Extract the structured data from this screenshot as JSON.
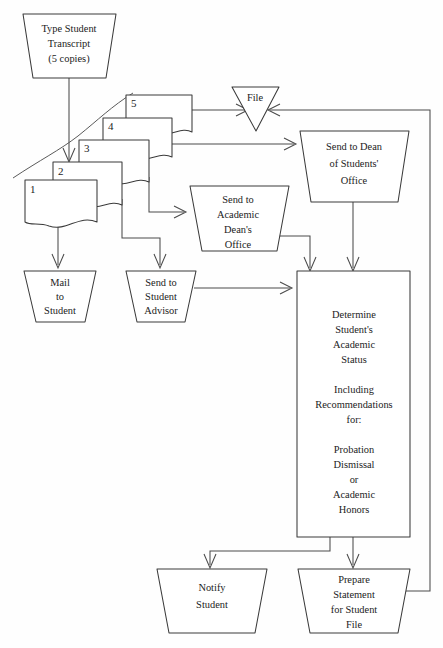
{
  "diagram": {
    "background_color": "#fefefe",
    "stroke_color": "#3a3a3a",
    "nodes": {
      "type_transcript": {
        "shape": "trapezoid",
        "lines": [
          "Type Student",
          "Transcript",
          "(5 copies)"
        ]
      },
      "file": {
        "shape": "inverted-triangle",
        "lines": [
          "File"
        ]
      },
      "dean_students": {
        "shape": "trapezoid",
        "lines": [
          "Send to Dean",
          "of Students'",
          "Office"
        ]
      },
      "academic_dean": {
        "shape": "trapezoid",
        "lines": [
          "Send to",
          "Academic",
          "Dean's",
          "Office"
        ]
      },
      "mail_student": {
        "shape": "trapezoid",
        "lines": [
          "Mail",
          "to",
          "Student"
        ]
      },
      "student_advisor": {
        "shape": "trapezoid",
        "lines": [
          "Send to",
          "Student",
          "Advisor"
        ]
      },
      "determine_status": {
        "shape": "rectangle",
        "lines": [
          "Determine",
          "Student's",
          "Academic",
          "Status",
          "",
          "Including",
          "Recommendations",
          "for:",
          "",
          "Probation",
          "Dismissal",
          "or",
          "Academic",
          "Honors"
        ]
      },
      "notify_student": {
        "shape": "trapezoid",
        "lines": [
          "Notify",
          "Student"
        ]
      },
      "prepare_statement": {
        "shape": "trapezoid",
        "lines": [
          "Prepare",
          "Statement",
          "for Student",
          "File"
        ]
      }
    },
    "documents": [
      {
        "number": "1"
      },
      {
        "number": "2"
      },
      {
        "number": "3"
      },
      {
        "number": "4"
      },
      {
        "number": "5"
      }
    ]
  }
}
